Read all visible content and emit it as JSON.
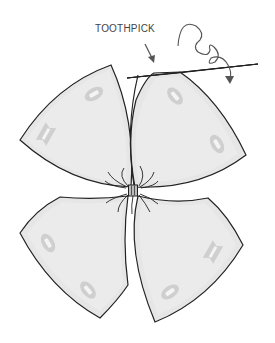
{
  "diagram": {
    "labels": {
      "toothpick": "TOOTHPICK"
    },
    "parts": [
      {
        "id": "petal-top-left",
        "description": "curved triangular panel with two grommet holes"
      },
      {
        "id": "petal-top-right",
        "description": "curved triangular panel with two grommet holes"
      },
      {
        "id": "petal-bottom-left",
        "description": "curved triangular panel with two grommet holes"
      },
      {
        "id": "petal-bottom-right",
        "description": "curved triangular panel with two grommet holes"
      },
      {
        "id": "center-knot",
        "description": "tied knot with fraying threads joining the four panels"
      },
      {
        "id": "toothpick",
        "description": "toothpick inserted along the top edge of the top-right panel"
      },
      {
        "id": "spiral-arrow",
        "description": "curly arrow indicating twisting/rolling motion"
      }
    ],
    "colors": {
      "panel_fill": "#e6e6e6",
      "panel_inner": "#ebebeb",
      "outline": "#222222",
      "grommet": "#cfcfcf",
      "grommet_hole": "#f4f4f4",
      "arrow": "#555555",
      "label": "#444444"
    }
  }
}
